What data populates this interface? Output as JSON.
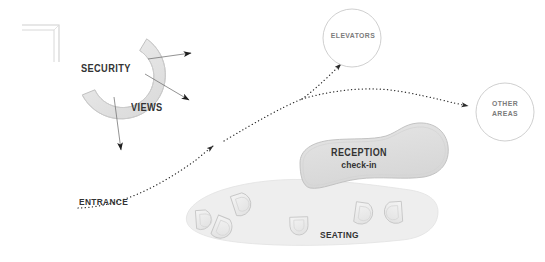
{
  "diagram": {
    "background_color": "#ffffff",
    "colors": {
      "fill_light": "#f2f2f2",
      "fill_mid": "#e0e0e0",
      "fill_zone": "#ededed",
      "stroke_light": "#c9c9c9",
      "stroke_mid": "#b5b5b5",
      "text_dark": "#333333",
      "text_mid": "#7b7b7b",
      "path_dotted": "#2b2b2b"
    },
    "labels": {
      "security": "SECURITY",
      "views": "VIEWS",
      "entrance": "ENTRANCE",
      "reception": "RECEPTION",
      "reception_sub": "check-in",
      "seating": "SEATING",
      "elevators": "ELEVATORS",
      "other_areas_line1": "OTHER",
      "other_areas_line2": "AREAS"
    },
    "nodes": [
      {
        "name": "wall-corner",
        "type": "wall-fragment",
        "label": ""
      },
      {
        "name": "security-arc",
        "type": "crescent",
        "label": "SECURITY"
      },
      {
        "name": "reception-blob",
        "type": "organic-mass",
        "label": "RECEPTION"
      },
      {
        "name": "seating-zone",
        "type": "zone",
        "label": "SEATING"
      },
      {
        "name": "elevators-node",
        "type": "circle-node",
        "label": "ELEVATORS"
      },
      {
        "name": "other-areas-node",
        "type": "circle-node",
        "label": "OTHER AREAS"
      }
    ],
    "view_arrows": [
      {
        "name": "view-arrow-east",
        "direction": "east"
      },
      {
        "name": "view-arrow-southeast",
        "direction": "southeast"
      },
      {
        "name": "view-arrow-south",
        "direction": "south"
      }
    ],
    "circulation_paths": [
      {
        "name": "entrance-to-reception",
        "style": "dotted",
        "from": "ENTRANCE",
        "to": "RECEPTION"
      },
      {
        "name": "reception-to-elevators",
        "style": "dotted",
        "from": "RECEPTION",
        "to": "ELEVATORS"
      },
      {
        "name": "reception-to-other-areas",
        "style": "dotted",
        "from": "RECEPTION",
        "to": "OTHER AREAS"
      }
    ],
    "seating_count": 6
  }
}
